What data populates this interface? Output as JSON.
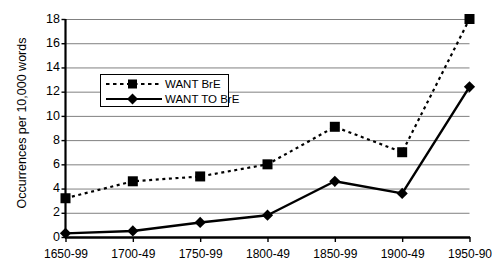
{
  "chart_data": {
    "type": "line",
    "title": "",
    "xlabel": "",
    "ylabel": "Occurrences per 10,000 words",
    "categories": [
      "1650-99",
      "1700-49",
      "1750-99",
      "1800-49",
      "1850-99",
      "1900-49",
      "1950-90"
    ],
    "series": [
      {
        "name": "WANT BrE",
        "values": [
          3.2,
          4.6,
          5.0,
          6.0,
          9.1,
          7.0,
          18.0
        ],
        "line_style": "dashed",
        "marker": "square",
        "color": "#000000"
      },
      {
        "name": "WANT TO BrE",
        "values": [
          0.3,
          0.5,
          1.2,
          1.8,
          4.6,
          3.6,
          12.4
        ],
        "line_style": "solid",
        "marker": "diamond",
        "color": "#000000"
      }
    ],
    "ylim": [
      0,
      18
    ],
    "yticks": [
      0,
      2,
      4,
      6,
      8,
      10,
      12,
      14,
      16,
      18
    ],
    "ytick_labels": [
      "0",
      "2",
      "4",
      "6",
      "8",
      "10",
      "12",
      "14",
      "16",
      "18"
    ],
    "grid": "horizontal",
    "gridline_color": "#808080",
    "legend_position": "upper-left-inside",
    "axis_color": "#000000",
    "background": "#ffffff"
  }
}
